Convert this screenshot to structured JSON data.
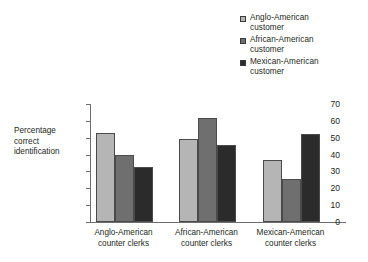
{
  "chart_data": {
    "type": "bar",
    "title": "",
    "xlabel": "",
    "ylabel": "Percentage\ncorrect\nidentification",
    "ylim": [
      0,
      70
    ],
    "yticks": [
      "0",
      "10",
      "20",
      "30",
      "40",
      "50",
      "60",
      "70"
    ],
    "grid": false,
    "legend_position": "top-right",
    "categories": [
      "Anglo-American\ncounter clerks",
      "African-American\ncounter clerks",
      "Mexican-American\ncounter clerks"
    ],
    "series": [
      {
        "name": "Anglo-American\ncustomer",
        "color": "#b5b5b5",
        "values": [
          53,
          49.5,
          37
        ]
      },
      {
        "name": "African-American\ncustomer",
        "color": "#6f6f6f",
        "values": [
          40,
          62,
          25.5
        ]
      },
      {
        "name": "Mexican-American\ncustomer",
        "color": "#2b2b2b",
        "values": [
          32.5,
          45.5,
          52
        ]
      }
    ]
  },
  "legend": {
    "items": [
      {
        "label": "Anglo-American\ncustomer",
        "color": "#b5b5b5"
      },
      {
        "label": "African-American\ncustomer",
        "color": "#6f6f6f"
      },
      {
        "label": "Mexican-American\ncustomer",
        "color": "#2b2b2b"
      }
    ]
  },
  "axis": {
    "y_title": "Percentage\ncorrect\nidentification",
    "y_ticks": [
      "70",
      "60",
      "50",
      "40",
      "30",
      "20",
      "10",
      "0"
    ],
    "x_categories": [
      "Anglo-American\ncounter clerks",
      "African-American\ncounter clerks",
      "Mexican-American\ncounter clerks"
    ]
  }
}
